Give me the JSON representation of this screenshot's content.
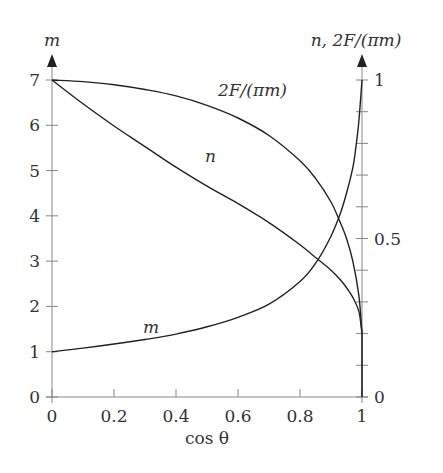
{
  "chart_data": {
    "type": "line",
    "title": "",
    "xlabel": "cos θ",
    "ylabel_left": "m",
    "ylabel_right": "n, 2F/(πm)",
    "xlim": [
      0,
      1
    ],
    "ylim_left": [
      0,
      7
    ],
    "ylim_right": [
      0,
      1
    ],
    "x_ticks": [
      "0",
      "0.2",
      "0.4",
      "0.6",
      "0.8",
      "1"
    ],
    "y_ticks_left": [
      "0",
      "1",
      "2",
      "3",
      "4",
      "5",
      "6",
      "7"
    ],
    "y_ticks_right_labeled": [
      "0",
      "0.5",
      "1"
    ],
    "y_ticks_right_minor_step": 0.1,
    "grid": false,
    "legend": "inline curve labels",
    "series": [
      {
        "name": "m",
        "axis": "left",
        "label": "m",
        "x": [
          0,
          0.1,
          0.2,
          0.3,
          0.4,
          0.5,
          0.6,
          0.7,
          0.8,
          0.85,
          0.9,
          0.93,
          0.95,
          0.97,
          0.98,
          0.99,
          1.0
        ],
        "values": [
          1.0,
          1.08,
          1.17,
          1.27,
          1.39,
          1.55,
          1.76,
          2.05,
          2.55,
          2.95,
          3.55,
          4.05,
          4.5,
          5.05,
          5.5,
          6.1,
          7.0
        ]
      },
      {
        "name": "n",
        "axis": "right",
        "label": "n",
        "x": [
          0,
          0.1,
          0.2,
          0.3,
          0.4,
          0.5,
          0.6,
          0.7,
          0.8,
          0.85,
          0.9,
          0.93,
          0.95,
          0.97,
          0.99,
          1.0
        ],
        "values": [
          1.0,
          0.925,
          0.855,
          0.79,
          0.725,
          0.665,
          0.61,
          0.55,
          0.48,
          0.44,
          0.4,
          0.37,
          0.345,
          0.315,
          0.27,
          0.2
        ]
      },
      {
        "name": "2F/(πm)",
        "axis": "right",
        "label": "2F/(πm)",
        "x": [
          0,
          0.1,
          0.2,
          0.3,
          0.4,
          0.5,
          0.6,
          0.7,
          0.8,
          0.85,
          0.9,
          0.93,
          0.95,
          0.97,
          0.99,
          1.0
        ],
        "values": [
          1.0,
          0.995,
          0.985,
          0.97,
          0.95,
          0.92,
          0.88,
          0.825,
          0.745,
          0.69,
          0.615,
          0.55,
          0.5,
          0.43,
          0.32,
          0.2
        ]
      }
    ]
  },
  "labels": {
    "left_axis_title": "m",
    "right_axis_title": "n, 2F/(πm)",
    "x_axis_title": "cos θ",
    "curve_m": "m",
    "curve_n": "n",
    "curve_f": "2F/(πm)"
  }
}
